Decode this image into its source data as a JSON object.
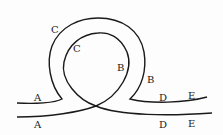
{
  "diagram": {
    "type": "loop-track",
    "stroke_color": "#1a1a1a",
    "labels": [
      {
        "id": "A_outer",
        "text": "A",
        "x": 34,
        "y": 93
      },
      {
        "id": "A_inner",
        "text": "A",
        "x": 34,
        "y": 120
      },
      {
        "id": "C_outer",
        "text": "C",
        "x": 51,
        "y": 25
      },
      {
        "id": "C_inner",
        "text": "C",
        "x": 73,
        "y": 44
      },
      {
        "id": "B_inner",
        "text": "B",
        "x": 117,
        "y": 63
      },
      {
        "id": "B_outer",
        "text": "B",
        "x": 147,
        "y": 75
      },
      {
        "id": "D_outer",
        "text": "D",
        "x": 159,
        "y": 93
      },
      {
        "id": "E_outer",
        "text": "E",
        "x": 188,
        "y": 91
      },
      {
        "id": "D_inner",
        "text": "D",
        "x": 159,
        "y": 120
      },
      {
        "id": "E_inner",
        "text": "E",
        "x": 188,
        "y": 119
      }
    ]
  }
}
